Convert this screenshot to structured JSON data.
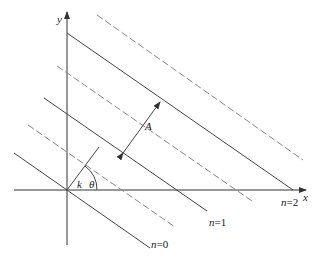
{
  "diagram": {
    "type": "plane-wave-wavefronts",
    "axes": {
      "x_label": "x",
      "y_label": "y"
    },
    "vector_label": "k",
    "angle_label": "θ",
    "amplitude_label": "A",
    "wavefront_labels": [
      {
        "n": "n",
        "eq": "=0"
      },
      {
        "n": "n",
        "eq": "=1"
      },
      {
        "n": "n",
        "eq": "=2"
      }
    ],
    "colors": {
      "solid_line": "#444444",
      "dashed_line": "#888888",
      "axis": "#333333",
      "text": "#222222"
    }
  }
}
